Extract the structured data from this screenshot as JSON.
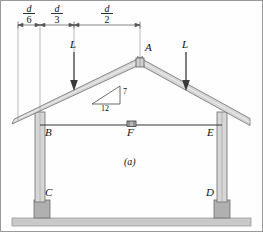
{
  "figure": {
    "caption": "(a)",
    "border": "#9a9a9a",
    "background": "#fefefe"
  },
  "dimensions": {
    "line_y": 25,
    "segments": [
      {
        "name": "d-over-6",
        "numerator": "d",
        "denominator": "6",
        "x_start": 18,
        "x_end": 40,
        "label_x": 21
      },
      {
        "name": "d-over-3",
        "numerator": "d",
        "denominator": "3",
        "x_start": 40,
        "x_end": 74,
        "label_x": 49
      },
      {
        "name": "d-over-2",
        "numerator": "d",
        "denominator": "2",
        "x_start": 74,
        "x_end": 140,
        "label_x": 99
      }
    ]
  },
  "loads": [
    {
      "name": "load-left",
      "label": "L",
      "x": 74,
      "label_y": 46,
      "arrow_top": 52,
      "arrow_bottom": 90
    },
    {
      "name": "load-right",
      "label": "L",
      "x": 186,
      "label_y": 46,
      "arrow_top": 52,
      "arrow_bottom": 90
    }
  ],
  "joints": {
    "A": {
      "label": "A",
      "x": 140,
      "y": 62,
      "label_x": 145,
      "label_y": 48
    },
    "B": {
      "label": "B",
      "x": 40,
      "y": 125,
      "label_x": 45,
      "label_y": 128
    },
    "C": {
      "label": "C",
      "x": 40,
      "y": 200,
      "label_x": 45,
      "label_y": 190
    },
    "D": {
      "label": "D",
      "x": 222,
      "y": 200,
      "label_x": 210,
      "label_y": 190
    },
    "E": {
      "label": "E",
      "x": 222,
      "y": 125,
      "label_x": 210,
      "label_y": 128
    },
    "F": {
      "label": "F",
      "x": 131,
      "y": 125,
      "label_x": 127,
      "label_y": 128
    }
  },
  "slope_triangle": {
    "name": "roof-slope-triangle",
    "rise_label": "7",
    "run_label": "12",
    "apex_x": 120,
    "apex_y": 86,
    "corner_x": 120,
    "corner_y": 104,
    "base_x": 92,
    "base_y": 104,
    "rise_label_x": 123,
    "rise_label_y": 90,
    "run_label_x": 101,
    "run_label_y": 106
  },
  "colors": {
    "member_fill": "#d6d6d6",
    "member_stroke": "#6e6e6e",
    "footing_fill": "#b0b0b0",
    "slab_fill": "#c9c9c9",
    "line": "#333333",
    "text": "#111111"
  },
  "geometry": {
    "apex": {
      "x": 140,
      "y": 62
    },
    "eave_left": {
      "x": 12,
      "y": 124
    },
    "eave_right": {
      "x": 250,
      "y": 122
    },
    "tie_beam_y": 125,
    "column_left_x": 40,
    "column_right_x": 222,
    "ground_y": 218,
    "rafter_thickness": 6
  }
}
